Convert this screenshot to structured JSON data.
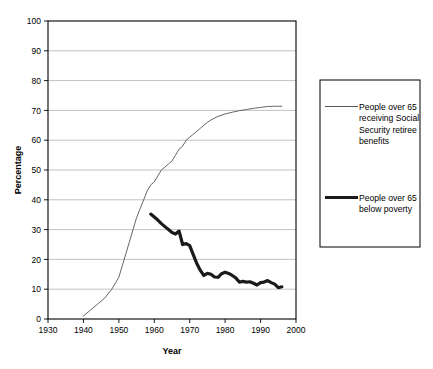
{
  "chart_data": {
    "type": "line",
    "title": "",
    "xlabel": "Year",
    "ylabel": "Percentage",
    "xlim": [
      1930,
      2000
    ],
    "ylim": [
      0,
      100
    ],
    "xticks": [
      1930,
      1940,
      1950,
      1960,
      1970,
      1980,
      1990,
      2000
    ],
    "yticks": [
      0,
      10,
      20,
      30,
      40,
      50,
      60,
      70,
      80,
      90,
      100
    ],
    "grid": "horizontal",
    "legend_position": "right-outside",
    "series": [
      {
        "name": "People over 65 receiving Social Security retiree benefits",
        "style": "thin",
        "color": "#555555",
        "x": [
          1940,
          1942,
          1944,
          1946,
          1948,
          1950,
          1951,
          1952,
          1953,
          1954,
          1955,
          1956,
          1957,
          1958,
          1959,
          1960,
          1961,
          1962,
          1963,
          1964,
          1965,
          1966,
          1967,
          1968,
          1969,
          1970,
          1971,
          1972,
          1973,
          1974,
          1975,
          1976,
          1977,
          1978,
          1980,
          1982,
          1984,
          1986,
          1988,
          1990,
          1992,
          1994,
          1996
        ],
        "y": [
          1,
          3,
          5,
          7,
          10,
          14,
          18,
          22,
          26,
          30,
          34,
          37,
          40,
          43,
          45,
          46,
          48,
          50,
          51,
          52,
          53,
          55,
          57,
          58,
          60,
          61,
          62,
          63,
          64,
          65,
          66,
          66.8,
          67.4,
          68,
          68.8,
          69.4,
          69.9,
          70.3,
          70.7,
          71,
          71.3,
          71.4,
          71.4
        ]
      },
      {
        "name": "People over 65 below poverty",
        "style": "thick",
        "color": "#1a1a1a",
        "x": [
          1959,
          1960,
          1961,
          1962,
          1963,
          1964,
          1965,
          1966,
          1967,
          1968,
          1969,
          1970,
          1971,
          1972,
          1973,
          1974,
          1975,
          1976,
          1977,
          1978,
          1979,
          1980,
          1981,
          1982,
          1983,
          1984,
          1985,
          1986,
          1987,
          1988,
          1989,
          1990,
          1991,
          1992,
          1993,
          1994,
          1995,
          1996
        ],
        "y": [
          35.2,
          34.2,
          33.2,
          32.0,
          31.0,
          30.0,
          29.0,
          28.5,
          29.5,
          25.0,
          25.3,
          24.6,
          21.6,
          18.6,
          16.3,
          14.6,
          15.3,
          15.0,
          14.1,
          14.0,
          15.2,
          15.7,
          15.3,
          14.6,
          13.8,
          12.4,
          12.6,
          12.4,
          12.5,
          12.0,
          11.4,
          12.2,
          12.4,
          12.9,
          12.2,
          11.7,
          10.5,
          10.8
        ]
      }
    ]
  },
  "axes": {
    "y_label": "Percentage",
    "x_label": "Year",
    "y_tick_labels": [
      "100",
      "90",
      "80",
      "70",
      "60",
      "50",
      "40",
      "30",
      "20",
      "10",
      "0"
    ],
    "x_tick_labels": [
      "1930",
      "1940",
      "1950",
      "1960",
      "1970",
      "1980",
      "1990",
      "2000"
    ]
  },
  "legend": {
    "entries": [
      {
        "swatch": "thin-line-swatch",
        "lines": [
          "People over 65",
          "receiving Social",
          "Security retiree",
          "benefits"
        ]
      },
      {
        "swatch": "thick-line-swatch",
        "lines": [
          "People over 65",
          "below poverty"
        ]
      }
    ]
  },
  "colors": {
    "plot_border": "#000000",
    "gridline": "#a8a8a8",
    "series_thin": "#555555",
    "series_thick": "#1a1a1a",
    "legend_border": "#000000",
    "background": "#ffffff"
  }
}
